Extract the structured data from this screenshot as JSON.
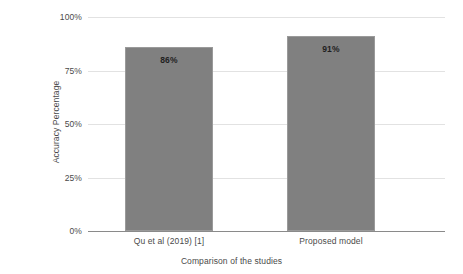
{
  "chart_data": {
    "type": "bar",
    "title": "",
    "categories": [
      "Qu et al (2019) [1]",
      "Proposed model"
    ],
    "values": [
      86,
      91
    ],
    "data_labels": [
      "86%",
      "91%"
    ],
    "xlabel": "Comparison of the studies",
    "ylabel": "Accuracy Percentage",
    "ylim": [
      0,
      100
    ],
    "yticks": [
      0,
      25,
      50,
      75,
      100
    ],
    "ytick_labels": [
      "0%",
      "25%",
      "50%",
      "75%",
      "100%"
    ],
    "grid": true,
    "grid_axis": "y",
    "legend": "none",
    "series": [
      {
        "name": "Accuracy Percentage",
        "values": [
          86,
          91
        ]
      }
    ],
    "colors": {
      "bar_fill": "#808080",
      "bar_edge": "#9a9a9a",
      "gridline": "#e2e2e2",
      "axis_line": "#8a8a8a",
      "text": "#4a4a4a",
      "value_label": "#1f1f1f",
      "background": "#ffffff"
    }
  }
}
